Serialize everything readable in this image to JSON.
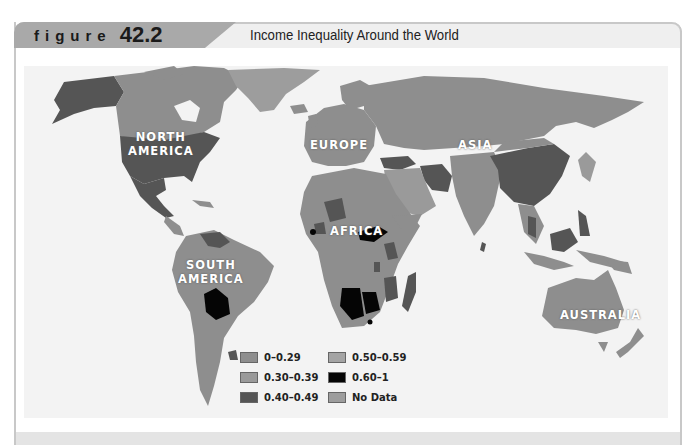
{
  "header": {
    "figure_word": "figure",
    "figure_number": "42.2",
    "title": "Income Inequality Around the World"
  },
  "map": {
    "continent_labels": {
      "north_america": "NORTH\nAMERICA",
      "north_america_l1": "NORTH",
      "north_america_l2": "AMERICA",
      "south_america_l1": "SOUTH",
      "south_america_l2": "AMERICA",
      "europe": "EUROPE",
      "asia": "ASIA",
      "africa": "AFRICA",
      "australia": "AUSTRALIA"
    },
    "colors": {
      "range_0_029": "#8e8e8e",
      "range_030_039": "#9a9a9a",
      "range_040_049": "#555555",
      "range_050_059": "#a4a4a4",
      "range_060_1": "#050505",
      "no_data": "#9d9d9d",
      "ocean": "#f3f3f3"
    }
  },
  "legend": {
    "items": [
      {
        "label": "0–0.29",
        "color": "#8e8e8e"
      },
      {
        "label": "0.30–0.39",
        "color": "#9a9a9a"
      },
      {
        "label": "0.40–0.49",
        "color": "#555555"
      },
      {
        "label": "0.50–0.59",
        "color": "#a4a4a4"
      },
      {
        "label": "0.60–1",
        "color": "#050505"
      },
      {
        "label": "No Data",
        "color": "#9d9d9d"
      }
    ]
  }
}
